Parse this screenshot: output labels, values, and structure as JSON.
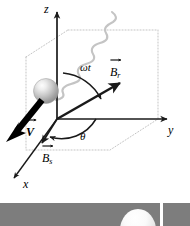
{
  "figure": {
    "name": "3d-field-geometry-diagram",
    "background_color": "#ffffff",
    "line_color": "#1a1a1a",
    "dotted_color": "#b9b9b9",
    "wave_color": "#c2c2c2",
    "strip_color": "#7d7d7d"
  },
  "axes": [
    {
      "id": "z",
      "label": "z",
      "direction": "up"
    },
    {
      "id": "y",
      "label": "y",
      "direction": "right"
    },
    {
      "id": "x",
      "label": "x",
      "direction": "lower-left"
    }
  ],
  "vectors": [
    {
      "id": "B_r",
      "label": "B",
      "subscript": "r",
      "accent": "arrow",
      "description": "rotating field vector pointing up-right from origin",
      "style": "solid-thin-black"
    },
    {
      "id": "B_s",
      "label": "B",
      "subscript": "s",
      "accent": "arrow",
      "description": "static field vector pointing along x toward lower-left",
      "style": "solid-thin-black"
    },
    {
      "id": "V",
      "label": "V",
      "subscript": "",
      "accent": "arrow",
      "description": "velocity vector, thick black arrow pointing lower-left",
      "style": "solid-thick-black"
    }
  ],
  "angles": [
    {
      "id": "omega-t",
      "label": "ωt",
      "description": "angle from z-axis to B_r vector"
    },
    {
      "id": "theta",
      "label": "θ",
      "description": "angle from y-axis to B_s vector in the xy-plane"
    }
  ],
  "objects": [
    {
      "id": "sphere",
      "name": "shaded-sphere",
      "description": "gray shaded sphere with highlight, on the z-axis side"
    },
    {
      "id": "wave",
      "name": "incident-wave",
      "description": "light gray wavy line entering from top right down to the sphere"
    },
    {
      "id": "reference-planes",
      "name": "dotted-reference-planes",
      "description": "light gray dotted parallelepiped outlining the xy and xz reference planes"
    }
  ],
  "bottom_strip": {
    "name": "adjacent-figure-strip",
    "description": "gray band from the next figure with a white dome and a white vertical separator"
  }
}
